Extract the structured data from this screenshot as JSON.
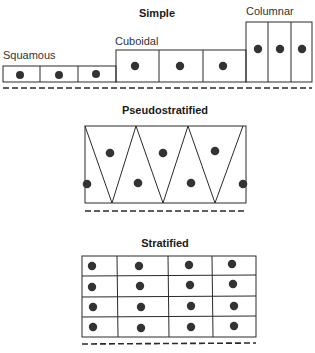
{
  "diagram": {
    "sections": {
      "simple": {
        "title": "Simple",
        "types": [
          {
            "label": "Squamous",
            "cells": 3
          },
          {
            "label": "Cuboidal",
            "cells": 3
          },
          {
            "label": "Columnar",
            "cells": 3
          }
        ]
      },
      "pseudostratified": {
        "title": "Pseudostratified",
        "nuclei": 9
      },
      "stratified": {
        "title": "Stratified",
        "rows": 4,
        "cols": 4
      }
    },
    "colors": {
      "line": "#2a2a2a",
      "nucleus": "#333333",
      "background": "#ffffff"
    }
  }
}
